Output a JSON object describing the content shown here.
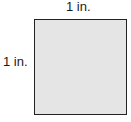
{
  "diagram": {
    "shape": "square",
    "top_label": "1 in.",
    "left_label": "1 in.",
    "fill_color": "#e5e5e5",
    "border_color": "#222222"
  }
}
